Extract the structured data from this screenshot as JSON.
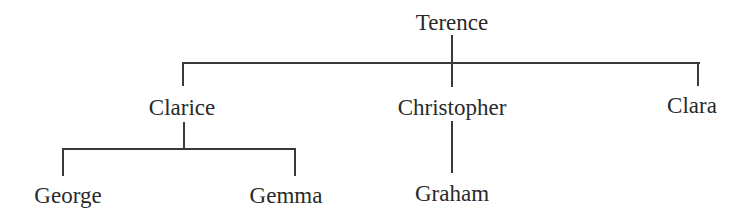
{
  "diagram": {
    "type": "family-tree",
    "root": {
      "name": "Terence",
      "children": [
        {
          "name": "Clarice",
          "children": [
            {
              "name": "George"
            },
            {
              "name": "Gemma"
            }
          ]
        },
        {
          "name": "Christopher",
          "children": [
            {
              "name": "Graham"
            }
          ]
        },
        {
          "name": "Clara"
        }
      ]
    }
  },
  "nodes": {
    "terence": "Terence",
    "clarice": "Clarice",
    "christopher": "Christopher",
    "clara": "Clara",
    "george": "George",
    "gemma": "Gemma",
    "graham": "Graham"
  },
  "colors": {
    "line": "#3a3a3a",
    "text": "#2a2a2a",
    "background": "#ffffff"
  }
}
